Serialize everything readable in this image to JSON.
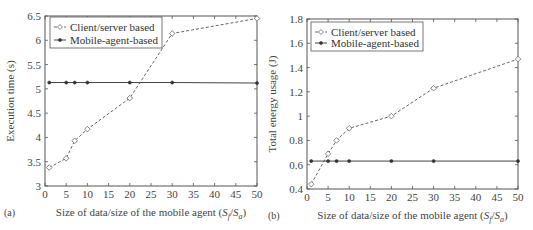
{
  "chart_data": [
    {
      "panel": "(a)",
      "type": "line",
      "title": "",
      "xlabel": "Size of data/size of the mobile agent (Sf/Sa)",
      "ylabel": "Execution time (s)",
      "xlim": [
        0,
        50
      ],
      "ylim": [
        3,
        6.5
      ],
      "xticks": [
        0,
        5,
        10,
        15,
        20,
        25,
        30,
        35,
        40,
        45,
        50
      ],
      "yticks": [
        3,
        3.5,
        4,
        4.5,
        5,
        5.5,
        6,
        6.5
      ],
      "grid": false,
      "legend_position": "upper left",
      "x": [
        1,
        5,
        7,
        10,
        20,
        30,
        50
      ],
      "series": [
        {
          "name": "Client/server based",
          "style": "dashed",
          "marker": "diamond-open",
          "values": [
            3.38,
            3.57,
            3.93,
            4.17,
            4.81,
            6.14,
            6.45
          ]
        },
        {
          "name": "Mobile-agent-based",
          "style": "solid",
          "marker": "dot-filled",
          "values": [
            5.13,
            5.13,
            5.13,
            5.13,
            5.13,
            5.13,
            5.12
          ]
        }
      ]
    },
    {
      "panel": "(b)",
      "type": "line",
      "title": "",
      "xlabel": "Size of data/size of the mobile agent (Sf/Sa)",
      "ylabel": "Total energy usage (J)",
      "xlim": [
        0,
        50
      ],
      "ylim": [
        0.4,
        1.8
      ],
      "xticks": [
        0,
        5,
        10,
        15,
        20,
        25,
        30,
        35,
        40,
        45,
        50
      ],
      "yticks": [
        0.4,
        0.6,
        0.8,
        1,
        1.2,
        1.4,
        1.6,
        1.8
      ],
      "grid": false,
      "legend_position": "upper left",
      "x": [
        1,
        5,
        7,
        10,
        20,
        30,
        50
      ],
      "series": [
        {
          "name": "Client/server based",
          "style": "dashed",
          "marker": "diamond-open",
          "values": [
            0.44,
            0.69,
            0.8,
            0.9,
            1.0,
            1.23,
            1.47
          ]
        },
        {
          "name": "Mobile-agent-based",
          "style": "solid",
          "marker": "dot-filled",
          "values": [
            0.63,
            0.63,
            0.63,
            0.63,
            0.63,
            0.63,
            0.63
          ]
        }
      ]
    }
  ],
  "panels": [
    {
      "label": "(a)",
      "xlabel_text": "Size of data/size of the mobile agent (",
      "xlabel_sub_f": "f",
      "xlabel_sub_a": "a",
      "ylabel": "Execution time (s)",
      "legend": [
        "Client/server based",
        "Mobile-agent-based"
      ]
    },
    {
      "label": "(b)",
      "xlabel_text": "Size of data/size of the mobile agent (",
      "xlabel_sub_f": "f",
      "xlabel_sub_a": "a",
      "ylabel": "Total energy usage (J)",
      "legend": [
        "Client/server based",
        "Mobile-agent-based"
      ]
    }
  ]
}
